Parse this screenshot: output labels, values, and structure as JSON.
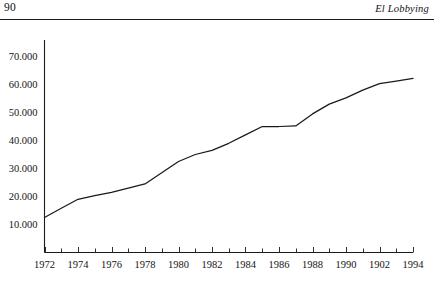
{
  "header": {
    "folio": "90",
    "running_title": "El Lobbying"
  },
  "chart_data": {
    "type": "line",
    "title": "",
    "xlabel": "",
    "ylabel": "",
    "xlim": [
      1972,
      1994
    ],
    "ylim": [
      0,
      75000
    ],
    "grid": false,
    "legend": null,
    "x_tick_labels": [
      "1972",
      "1974",
      "1976",
      "1978",
      "1980",
      "1982",
      "1984",
      "1986",
      "1988",
      "1990",
      "1902",
      "1994"
    ],
    "x_tick_values": [
      1972,
      1974,
      1976,
      1978,
      1980,
      1982,
      1984,
      1986,
      1988,
      1990,
      1992,
      1994
    ],
    "y_tick_labels": [
      "10.000",
      "20.000",
      "30.000",
      "40.000",
      "50.000",
      "60.000",
      "70.000"
    ],
    "y_tick_values": [
      10000,
      20000,
      30000,
      40000,
      50000,
      60000,
      70000
    ],
    "minor_x_ticks": [
      1973,
      1975,
      1977,
      1979,
      1981,
      1983,
      1985,
      1987,
      1989,
      1991,
      1993
    ],
    "series": [
      {
        "name": "",
        "x": [
          1972,
          1973,
          1974,
          1975,
          1976,
          1977,
          1978,
          1979,
          1980,
          1981,
          1982,
          1983,
          1984,
          1985,
          1986,
          1987,
          1988,
          1989,
          1990,
          1991,
          1992,
          1993,
          1994
        ],
        "values": [
          12500,
          15800,
          19000,
          20300,
          21500,
          23000,
          24500,
          28500,
          32500,
          35000,
          36500,
          39000,
          42000,
          45000,
          45000,
          45200,
          49500,
          53000,
          55200,
          58000,
          60300,
          61200,
          62200
        ]
      }
    ],
    "line_color": "#1a1a1a",
    "axis_color": "#1a1a1a"
  }
}
